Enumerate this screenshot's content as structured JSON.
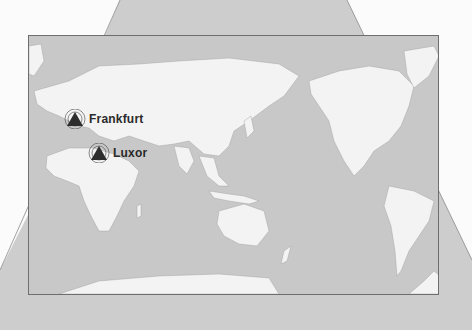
{
  "map": {
    "type": "world-physical-pacific-centered",
    "background_color": "#c8c8c8",
    "land_color": "#f2f2f2",
    "frame_color": "#6e6e6e"
  },
  "markers": [
    {
      "label": "Frankfurt",
      "icon": "radar-pyramid-icon"
    },
    {
      "label": "Luxor",
      "icon": "radar-pyramid-icon"
    }
  ]
}
